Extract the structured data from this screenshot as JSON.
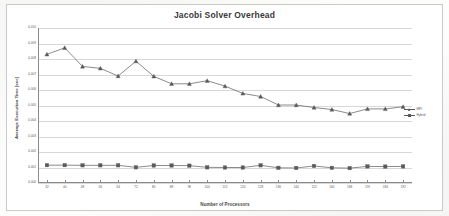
{
  "chart_data": {
    "type": "line",
    "title": "Jacobi Solver Overhead",
    "xlabel": "Number of Processors",
    "ylabel": "Average Execution Time [sec]",
    "grid": true,
    "legend_position": "right",
    "ylim": [
      0.0,
      0.01
    ],
    "ytick_labels": [
      "0.010",
      "0.009",
      "0.008",
      "0.007",
      "0.006",
      "0.005",
      "0.004",
      "0.003",
      "0.002",
      "0.001",
      "0.000"
    ],
    "ytick_values": [
      0.01,
      0.009,
      0.008,
      0.007,
      0.006,
      0.005,
      0.004,
      0.003,
      0.002,
      0.001,
      0.0
    ],
    "categories": [
      "32",
      "40",
      "48",
      "56",
      "64",
      "72",
      "80",
      "88",
      "96",
      "104",
      "112",
      "120",
      "128",
      "136",
      "144",
      "152",
      "160",
      "168",
      "176",
      "184",
      "192"
    ],
    "series": [
      {
        "name": "MPI",
        "marker": "triangle",
        "color": "#595959",
        "values": [
          0.0083,
          0.00872,
          0.00752,
          0.0074,
          0.0069,
          0.00786,
          0.00688,
          0.0064,
          0.0064,
          0.0066,
          0.00625,
          0.00578,
          0.00558,
          0.00503,
          0.00503,
          0.00487,
          0.00474,
          0.00448,
          0.00478,
          0.00478,
          0.00492
        ]
      },
      {
        "name": "Hybrid",
        "marker": "square",
        "color": "#595959",
        "values": [
          0.00115,
          0.00115,
          0.00114,
          0.00114,
          0.00114,
          0.00101,
          0.00113,
          0.00113,
          0.00112,
          0.00101,
          0.001,
          0.001,
          0.00114,
          0.00098,
          0.00097,
          0.0011,
          0.00098,
          0.00096,
          0.00107,
          0.00106,
          0.00107
        ]
      }
    ]
  }
}
